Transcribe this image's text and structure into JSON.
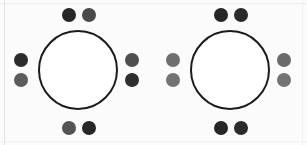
{
  "figure": {
    "type": "lewis-dot-structure",
    "width": 307,
    "height": 145,
    "background_color": "#fbfbfb",
    "frame_line_color": "#e2e2e2"
  },
  "style": {
    "core_stroke_color": "#1b1b1b",
    "core_fill_color": "#ffffff",
    "core_diameter": 80,
    "core_stroke_width": 2,
    "electron_diameter": 14,
    "electron_dark": "#2b2b2b",
    "electron_medium": "#565656",
    "electron_light": "#6f6f6f",
    "electron_gray": "#7b7b7b"
  },
  "atoms": [
    {
      "id": "atom-left",
      "label": "",
      "electron_count": 8,
      "electrons": [
        {
          "position": "top-left",
          "slot": "pos-top-a",
          "color": "#262626"
        },
        {
          "position": "top-right",
          "slot": "pos-top-b",
          "color": "#4a4a4a"
        },
        {
          "position": "left-upper",
          "slot": "pos-left-a",
          "color": "#2b2b2b"
        },
        {
          "position": "left-lower",
          "slot": "pos-left-b",
          "color": "#5c5c5c"
        },
        {
          "position": "right-upper",
          "slot": "pos-right-a",
          "color": "#4f4f4f"
        },
        {
          "position": "right-lower",
          "slot": "pos-right-b",
          "color": "#2e2e2e"
        },
        {
          "position": "bottom-left",
          "slot": "pos-bottom-a",
          "color": "#545454"
        },
        {
          "position": "bottom-right",
          "slot": "pos-bottom-b",
          "color": "#262626"
        }
      ]
    },
    {
      "id": "atom-right",
      "label": "",
      "electron_count": 8,
      "electrons": [
        {
          "position": "top-left",
          "slot": "pos-top-a",
          "color": "#262626"
        },
        {
          "position": "top-right",
          "slot": "pos-top-b",
          "color": "#2b2b2b"
        },
        {
          "position": "left-upper",
          "slot": "pos-left-a",
          "color": "#6f6f6f"
        },
        {
          "position": "left-lower",
          "slot": "pos-left-b",
          "color": "#737373"
        },
        {
          "position": "right-upper",
          "slot": "pos-right-a",
          "color": "#6b6b6b"
        },
        {
          "position": "right-lower",
          "slot": "pos-right-b",
          "color": "#737373"
        },
        {
          "position": "bottom-left",
          "slot": "pos-bottom-a",
          "color": "#262626"
        },
        {
          "position": "bottom-right",
          "slot": "pos-bottom-b",
          "color": "#2b2b2b"
        }
      ]
    }
  ]
}
